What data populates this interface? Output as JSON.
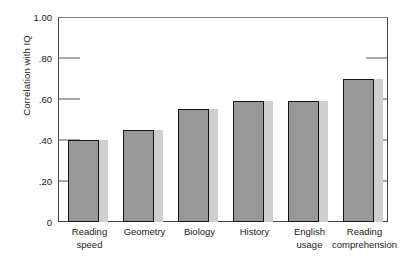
{
  "chart_data": {
    "type": "bar",
    "title": "",
    "subtitle": "",
    "xlabel": "",
    "ylabel": "Correlation with IQ",
    "ylim": [
      0,
      1.0
    ],
    "ytick_labels": [
      "0",
      ".20",
      ".40",
      ".60",
      ".80",
      "1.00"
    ],
    "ytick_values": [
      0,
      0.2,
      0.4,
      0.6,
      0.8,
      1.0
    ],
    "grid": false,
    "legend": null,
    "categories": [
      "Reading speed",
      "Geometry",
      "Biology",
      "History",
      "English usage",
      "Reading comprehension"
    ],
    "category_lines": [
      [
        "Reading",
        "speed"
      ],
      [
        "Geometry",
        ""
      ],
      [
        "Biology",
        ""
      ],
      [
        "History",
        ""
      ],
      [
        "English",
        "usage"
      ],
      [
        "Reading",
        "comprehension"
      ]
    ],
    "values": [
      0.4,
      0.45,
      0.55,
      0.59,
      0.59,
      0.7
    ],
    "bar_style": "3d-offset-shadow",
    "colors": {
      "bar_face": "#989898",
      "bar_shadow": "#cfcfcf",
      "bar_outline": "#161616",
      "axis": "#444444",
      "text": "#1a1a1a",
      "background": "#ffffff"
    }
  }
}
